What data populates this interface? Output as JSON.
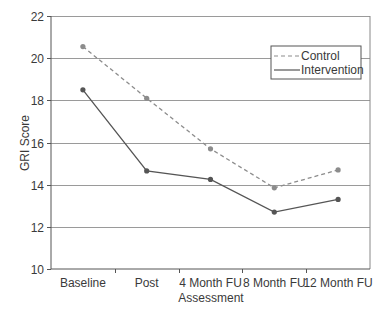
{
  "chart_data": {
    "type": "line",
    "title": "",
    "xlabel": "Assessment",
    "ylabel": "GRI Score",
    "categories": [
      "Baseline",
      "Post",
      "4 Month FU",
      "8 Month FU",
      "12 Month FU"
    ],
    "series": [
      {
        "name": "Control",
        "style": "dashed",
        "color": "#8c8c8c",
        "values": [
          20.55,
          18.1,
          15.7,
          13.85,
          14.7
        ]
      },
      {
        "name": "Intervention",
        "style": "solid",
        "color": "#555555",
        "values": [
          18.5,
          14.65,
          14.25,
          12.7,
          13.3
        ]
      }
    ],
    "ylim": [
      10,
      22
    ],
    "yticks": [
      10,
      12,
      14,
      16,
      18,
      20,
      22
    ],
    "grid": true,
    "legend_position": "upper right"
  },
  "legend": {
    "items": [
      {
        "label": "Control"
      },
      {
        "label": "Intervention"
      }
    ]
  },
  "axes": {
    "x_title": "Assessment",
    "y_title": "GRI Score"
  }
}
